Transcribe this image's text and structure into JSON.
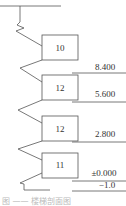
{
  "diagram": {
    "type": "building-section-schematic",
    "floors": [
      {
        "box_label": "10",
        "elevation": "8.400"
      },
      {
        "box_label": "12",
        "elevation": "5.600"
      },
      {
        "box_label": "12",
        "elevation": "2.800"
      },
      {
        "box_label": "11",
        "elevation": "±0.000"
      }
    ],
    "base_elevation": "−1.0",
    "caption": "图 —— 楼梯剖面图"
  },
  "colors": {
    "line": "#555555",
    "text": "#333333"
  }
}
